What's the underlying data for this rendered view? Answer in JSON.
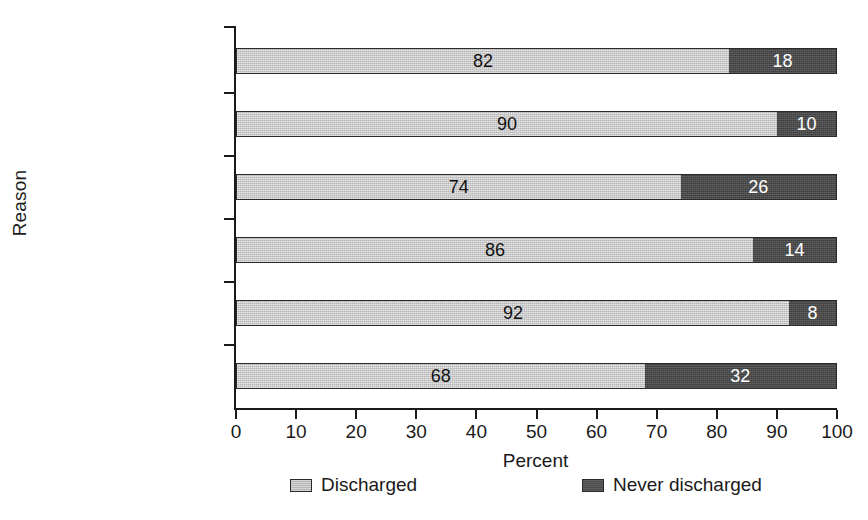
{
  "chart_data": {
    "type": "bar",
    "orientation": "horizontal",
    "stacked": true,
    "stack_total": 100,
    "title": "",
    "xlabel": "Percent",
    "ylabel": "Reason",
    "xlim": [
      0,
      100
    ],
    "xticks": [
      0,
      10,
      20,
      30,
      40,
      50,
      60,
      70,
      80,
      90,
      100
    ],
    "xtick_labels": [
      "0",
      "10",
      "20",
      "30",
      "40",
      "50",
      "60",
      "70",
      "80",
      "90",
      "100"
    ],
    "grid": false,
    "legend_position": "bottom",
    "categories": [
      "Total",
      "Uncategorized",
      "Voluntary placement",
      "Juvenile delinquency",
      "Status offense",
      "Abuse/neglect"
    ],
    "series": [
      {
        "name": "Discharged",
        "color": "#b5b5b5",
        "values": [
          82,
          90,
          74,
          86,
          92,
          68
        ],
        "value_labels": [
          "82",
          "90",
          "74",
          "86",
          "92",
          "68"
        ]
      },
      {
        "name": "Never discharged",
        "color": "#4a4a4a",
        "values": [
          18,
          10,
          26,
          14,
          8,
          32
        ],
        "value_labels": [
          "18",
          "10",
          "26",
          "14",
          "8",
          "32"
        ]
      }
    ]
  },
  "legend": {
    "items": [
      {
        "label": "Discharged",
        "swatch": "light"
      },
      {
        "label": "Never discharged",
        "swatch": "dark"
      }
    ]
  },
  "colors": {
    "discharged": "#b5b5b5",
    "never_discharged": "#4a4a4a",
    "axis": "#1a1a1a",
    "background": "#ffffff"
  }
}
